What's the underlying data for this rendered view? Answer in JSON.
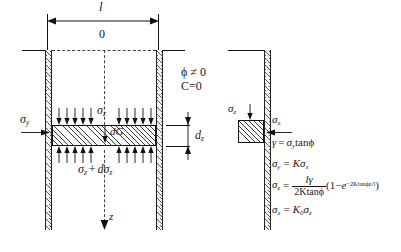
{
  "diagram": {
    "title_hidden": "",
    "dimension": {
      "width_label": "l",
      "origin_label": "0"
    },
    "conditions": {
      "phi": "ϕ ≠ 0",
      "cohesion": "C=0"
    },
    "stress_labels": {
      "sigma_y_left": "σ",
      "sigma_y_left_sub": "y",
      "sigma_z_top": "σ",
      "sigma_z_top_sub": "z",
      "self_weight": "dG",
      "sigma_z_bottom_pre": "σ",
      "sigma_z_bottom_pre_sub": "z",
      "sigma_z_bottom_plus": "+",
      "sigma_z_bottom_post": "dσ",
      "sigma_z_bottom_post_sub": "z",
      "dz": "d",
      "dz_sub": "z",
      "depth_axis": "z",
      "sigma_z_right": "σ",
      "sigma_z_right_sub": "z",
      "sigma_x_right": "σ",
      "sigma_x_right_sub": "x"
    },
    "equations": [
      {
        "id": "eq-gamma",
        "lhs": "γ",
        "eq": "=",
        "rhs": "σ",
        "rhs_sub": "y",
        "rhs_tail": "tanϕ"
      },
      {
        "id": "eq-sigma-y",
        "lhs": "σ",
        "lhs_sub": "y",
        "eq": "=",
        "rhs": "Kσ",
        "rhs_sub": "x"
      },
      {
        "id": "eq-sigma-z",
        "lhs": "σ",
        "lhs_sub": "z",
        "eq": "=",
        "numerator": "lγ",
        "denominator": "2Ktanϕ",
        "factor_open": "(1",
        "factor_minus": "−",
        "factor_e": "e",
        "factor_exp": "−2Ktanϕz/l",
        "factor_close": ")"
      },
      {
        "id": "eq-sigma-x",
        "lhs": "σ",
        "lhs_sub": "x",
        "eq": "=",
        "rhs": "K",
        "rhs_sub": "0",
        "rhs_tail": "σ",
        "rhs_tail_sub": "z"
      }
    ],
    "colors": {
      "ink": "#111111",
      "hatch": "#5a5a5a",
      "dashed": "#444444",
      "paper": "#ffffff"
    }
  }
}
